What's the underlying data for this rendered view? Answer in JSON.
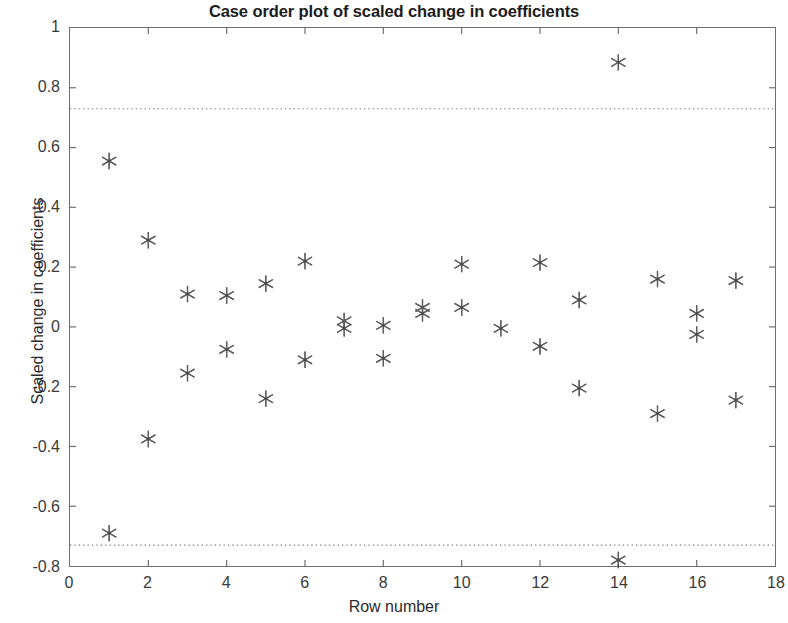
{
  "chart_data": {
    "type": "scatter",
    "title": "Case order plot of scaled change in coefficients",
    "xlabel": "Row number",
    "ylabel": "Scaled change in coefficients",
    "xlim": [
      0,
      18
    ],
    "ylim": [
      -0.8,
      1
    ],
    "xticks": [
      0,
      2,
      4,
      6,
      8,
      10,
      12,
      14,
      16,
      18
    ],
    "xtick_labels": [
      "0",
      "2",
      "4",
      "6",
      "8",
      "10",
      "12",
      "14",
      "16",
      "18"
    ],
    "yticks": [
      -0.8,
      -0.6,
      -0.4,
      -0.2,
      0,
      0.2,
      0.4,
      0.6,
      0.8,
      1
    ],
    "ytick_labels": [
      "-0.8",
      "-0.6",
      "-0.4",
      "-0.2",
      "0",
      "0.2",
      "0.4",
      "0.6",
      "0.8",
      "1"
    ],
    "grid": false,
    "legend": null,
    "marker": "asterisk",
    "marker_color": "#555555",
    "reference_lines": [
      {
        "name": "upper-threshold",
        "y": 0.73,
        "style": "dotted",
        "color": "#7a7a7a"
      },
      {
        "name": "lower-threshold",
        "y": -0.73,
        "style": "dotted",
        "color": "#7a7a7a"
      }
    ],
    "x": [
      1,
      1,
      2,
      2,
      3,
      3,
      4,
      4,
      5,
      5,
      6,
      6,
      7,
      7,
      8,
      8,
      9,
      9,
      10,
      10,
      11,
      12,
      12,
      13,
      13,
      14,
      14,
      15,
      15,
      16,
      16,
      17,
      17
    ],
    "y": [
      0.555,
      -0.69,
      0.29,
      -0.375,
      0.11,
      -0.155,
      0.105,
      -0.075,
      0.145,
      -0.24,
      0.22,
      -0.11,
      0.02,
      -0.005,
      0.005,
      -0.105,
      0.065,
      0.045,
      0.21,
      0.065,
      -0.005,
      0.215,
      -0.065,
      0.09,
      -0.205,
      0.885,
      -0.78,
      0.16,
      -0.29,
      0.045,
      -0.025,
      0.155,
      -0.245
    ],
    "points": [
      {
        "row": 1,
        "value": 0.555
      },
      {
        "row": 1,
        "value": -0.69
      },
      {
        "row": 2,
        "value": 0.29
      },
      {
        "row": 2,
        "value": -0.375
      },
      {
        "row": 3,
        "value": 0.11
      },
      {
        "row": 3,
        "value": -0.155
      },
      {
        "row": 4,
        "value": 0.105
      },
      {
        "row": 4,
        "value": -0.075
      },
      {
        "row": 5,
        "value": 0.145
      },
      {
        "row": 5,
        "value": -0.24
      },
      {
        "row": 6,
        "value": 0.22
      },
      {
        "row": 6,
        "value": -0.11
      },
      {
        "row": 7,
        "value": 0.02
      },
      {
        "row": 7,
        "value": -0.005
      },
      {
        "row": 8,
        "value": 0.005
      },
      {
        "row": 8,
        "value": -0.105
      },
      {
        "row": 9,
        "value": 0.065
      },
      {
        "row": 9,
        "value": 0.045
      },
      {
        "row": 10,
        "value": 0.21
      },
      {
        "row": 10,
        "value": 0.065
      },
      {
        "row": 11,
        "value": -0.005
      },
      {
        "row": 12,
        "value": 0.215
      },
      {
        "row": 12,
        "value": -0.065
      },
      {
        "row": 13,
        "value": 0.09
      },
      {
        "row": 13,
        "value": -0.205
      },
      {
        "row": 14,
        "value": 0.885
      },
      {
        "row": 14,
        "value": -0.78
      },
      {
        "row": 15,
        "value": 0.16
      },
      {
        "row": 15,
        "value": -0.29
      },
      {
        "row": 16,
        "value": 0.045
      },
      {
        "row": 16,
        "value": -0.025
      },
      {
        "row": 17,
        "value": 0.155
      },
      {
        "row": 17,
        "value": -0.245
      }
    ]
  }
}
